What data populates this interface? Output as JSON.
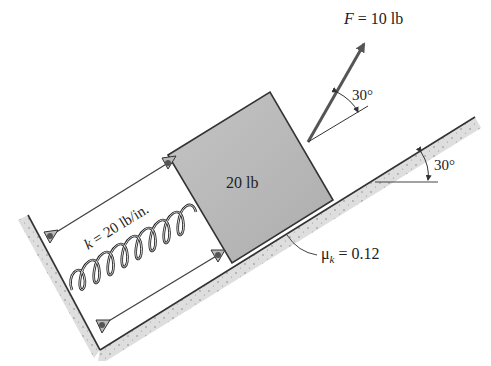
{
  "diagram": {
    "type": "mechanics-free-body-setup",
    "force": {
      "symbol": "F",
      "equals": " = ",
      "value": "10 lb",
      "angle_label": "30°"
    },
    "block": {
      "weight_label": "20 lb"
    },
    "spring": {
      "symbol": "k",
      "equals": " = ",
      "value": "20 lb/in."
    },
    "incline": {
      "angle_label": "30°"
    },
    "friction": {
      "symbol": "μ",
      "subscript": "k",
      "equals": " = ",
      "value": "0.12"
    },
    "colors": {
      "block_fill": "#b8b8b8",
      "ground_fill": "#dcdcdc",
      "line": "#333333",
      "arrow": "#555555"
    }
  }
}
